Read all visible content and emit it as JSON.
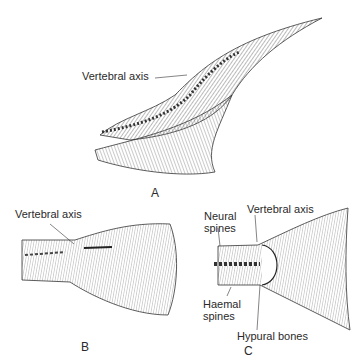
{
  "figure": {
    "panels": [
      {
        "id": "A",
        "letter": "A",
        "description": "heterocercal caudal fin",
        "labels": [
          "Vertebral axis"
        ]
      },
      {
        "id": "B",
        "letter": "B",
        "description": "diphycercal/abbreviated caudal fin",
        "labels": [
          "Vertebral axis"
        ]
      },
      {
        "id": "C",
        "letter": "C",
        "description": "homocercal caudal fin",
        "labels": [
          "Neural spines",
          "Vertebral axis",
          "Haemal spines",
          "Hypural bones"
        ]
      }
    ],
    "labels": {
      "a_vertebral": "Vertebral axis",
      "b_vertebral": "Vertebral axis",
      "c_neural_1": "Neural",
      "c_neural_2": "spines",
      "c_vertebral": "Vertebral axis",
      "c_haemal_1": "Haemal",
      "c_haemal_2": "spines",
      "c_hypural": "Hypural bones"
    },
    "letters": {
      "a": "A",
      "b": "B",
      "c": "C"
    },
    "colors": {
      "ink": "#2a2a2a",
      "paper": "#ffffff"
    }
  }
}
